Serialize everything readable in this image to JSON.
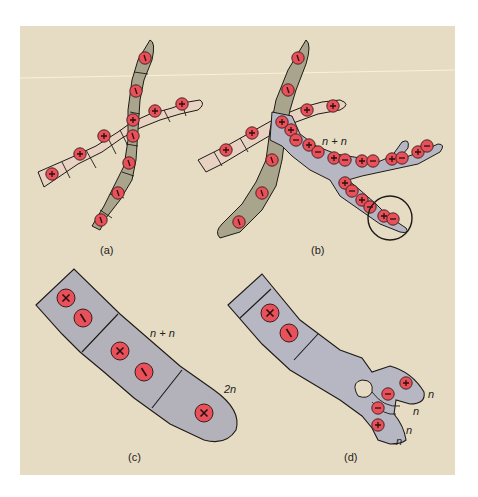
{
  "figure": {
    "colors": {
      "background": "#e6dcc3",
      "plus_hypha": "#e8d3c2",
      "minus_hypha": "#a9a58c",
      "dikaryon": "#b7b7c4",
      "dikaryon_large": "#b3b1b9",
      "nucleus": "#e8505a",
      "outline": "#1e1a16"
    },
    "panels": [
      {
        "id": "a",
        "label": "(a)",
        "nucleus_signs": [
          "+",
          "−"
        ]
      },
      {
        "id": "b",
        "label": "(b)",
        "annotation": "n + n",
        "highlight": "circle"
      },
      {
        "id": "c",
        "label": "(c)",
        "annotations": [
          "n + n",
          "2n"
        ]
      },
      {
        "id": "d",
        "label": "(d)",
        "annotations": [
          "n",
          "n",
          "n",
          "n"
        ]
      }
    ]
  }
}
